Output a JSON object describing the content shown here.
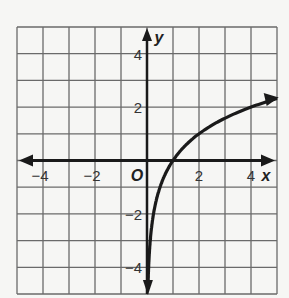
{
  "chart_data": {
    "type": "line",
    "title": "",
    "xlabel": "x",
    "ylabel": "y",
    "origin_label": "O",
    "xlim": [
      -5,
      5
    ],
    "ylim": [
      -5,
      5
    ],
    "grid": true,
    "x_ticks": [
      {
        "value": -4,
        "label": "−4"
      },
      {
        "value": -2,
        "label": "−2"
      },
      {
        "value": 2,
        "label": "2"
      },
      {
        "value": 4,
        "label": "4"
      }
    ],
    "y_ticks": [
      {
        "value": 4,
        "label": "4"
      },
      {
        "value": 2,
        "label": "2"
      },
      {
        "value": -2,
        "label": "−2"
      },
      {
        "value": -4,
        "label": "−4"
      }
    ],
    "series": [
      {
        "name": "y = log2(x)",
        "points": [
          [
            0.0313,
            -5
          ],
          [
            0.0625,
            -4
          ],
          [
            0.125,
            -3
          ],
          [
            0.25,
            -2
          ],
          [
            0.5,
            -1
          ],
          [
            1,
            0
          ],
          [
            2,
            1
          ],
          [
            3,
            1.585
          ],
          [
            4,
            2
          ],
          [
            5,
            2.32
          ]
        ],
        "arrows": "both ends"
      }
    ]
  }
}
